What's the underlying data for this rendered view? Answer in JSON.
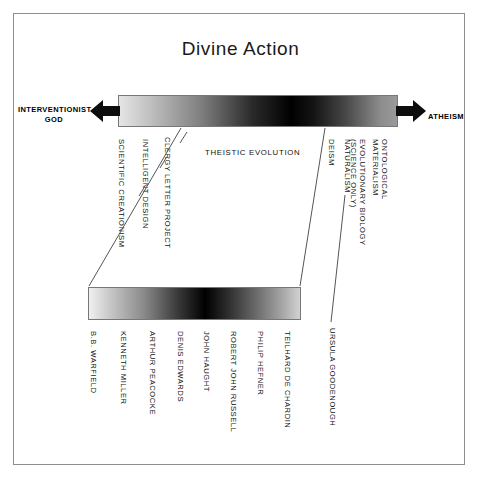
{
  "title": "Divine Action",
  "ends": {
    "left": "INTERVENTIONIST\nGOD",
    "left_line1": "INTERVENTIONIST",
    "left_line2": "GOD",
    "right": "ATHEISM",
    "left_arrow_icon": "arrow-left-icon",
    "right_arrow_icon": "arrow-right-icon"
  },
  "center_label": "THEISTIC EVOLUTION",
  "top_spectrum": {
    "name": "divine-action-spectrum",
    "gradient_stops": [
      "#e6e6e6",
      "#bdbdbd",
      "#7d7d7d",
      "#2a2a2a",
      "#000000",
      "#141414",
      "#4a4a4a",
      "#8c8c8c",
      "#9a9a9a"
    ],
    "positions_pct": [
      0,
      12,
      30,
      48,
      62,
      70,
      82,
      94,
      100
    ]
  },
  "lower_spectrum": {
    "name": "theistic-evolution-spectrum",
    "gradient_stops": [
      "#f0f0f0",
      "#c7c7c7",
      "#8a8a8a",
      "#3a3a3a",
      "#000000",
      "#2e2e2e",
      "#6e6e6e",
      "#a8a8a8",
      "#d2d2d2"
    ],
    "positions_pct": [
      0,
      10,
      26,
      42,
      55,
      66,
      80,
      92,
      100
    ]
  },
  "positions_left": [
    {
      "label": "SCIENTIFIC CREATIONISM",
      "key": "scientific-creationism",
      "x": 126,
      "y": 139,
      "lines": 1
    },
    {
      "label": "INTELLIGENT DESIGN",
      "key": "intelligent-design",
      "x": 150,
      "y": 139,
      "lines": 1
    },
    {
      "label": "CLERGY LETTER PROJECT",
      "key": "clergy-letter-project",
      "x": 172,
      "y": 137,
      "lines": 1
    }
  ],
  "positions_right": [
    {
      "label": "DEISM",
      "key": "deism",
      "x": 336,
      "y": 139,
      "lines": 1
    },
    {
      "label": "NATURALISM",
      "key": "naturalism",
      "x": 352,
      "y": 139,
      "lines": 1
    },
    {
      "label": "EVOLUTIONARY BIOLOGY\n(SCIENCE ONLY)",
      "key": "evolutionary-biology",
      "x": 366,
      "y": 139,
      "lines": 2
    },
    {
      "label": "ONTOLOGICAL\nMATERIALISM",
      "key": "ontological-materialism",
      "x": 388,
      "y": 139,
      "lines": 2
    }
  ],
  "thinkers": [
    {
      "label": "B.B. WARFIELD",
      "key": "bb-warfield",
      "x": 98,
      "y": 331
    },
    {
      "label": "KENNETH MILLER",
      "key": "kenneth-miller",
      "x": 128,
      "y": 331
    },
    {
      "label": "ARTHUR PEACOCKE",
      "key": "arthur-peacocke",
      "x": 157,
      "y": 331
    },
    {
      "label": "DENIS EDWARDS",
      "key": "denis-edwards",
      "x": 185,
      "y": 331
    },
    {
      "label": "JOHN HAUGHT",
      "key": "john-haught",
      "x": 211,
      "y": 331
    },
    {
      "label": "ROBERT JOHN RUSSELL",
      "key": "robert-john-russell",
      "x": 238,
      "y": 331
    },
    {
      "label": "PHILIP HEFNER",
      "key": "philip-hefner",
      "x": 265,
      "y": 331
    },
    {
      "label": "TEILHARD DE CHARDIN",
      "key": "teilhard-de-chardin",
      "x": 292,
      "y": 331
    },
    {
      "label": "URSULA GOODENOUGH",
      "key": "ursula-goodenough",
      "x": 337,
      "y": 328
    }
  ],
  "connectors": [
    {
      "key": "left-connector",
      "x1": 181,
      "y1": 128,
      "x2": 89,
      "y2": 286
    },
    {
      "key": "right-connector",
      "x1": 325,
      "y1": 128,
      "x2": 300,
      "y2": 286
    },
    {
      "key": "ursula-leader",
      "x1": 345,
      "y1": 195,
      "x2": 331,
      "y2": 322
    },
    {
      "key": "tick-scientific-creationism",
      "x1": 139,
      "y1": 196,
      "x2": 145,
      "y2": 186
    },
    {
      "key": "tick-intelligent-design",
      "x1": 160,
      "y1": 168,
      "x2": 166,
      "y2": 158
    },
    {
      "key": "tick-clergy-letter-project",
      "x1": 180,
      "y1": 143,
      "x2": 187,
      "y2": 132
    }
  ],
  "colors": {
    "frame_border": "#8d8d8d",
    "bar_border": "#777777",
    "text": "#111111",
    "line": "#555555",
    "background": "#ffffff"
  }
}
